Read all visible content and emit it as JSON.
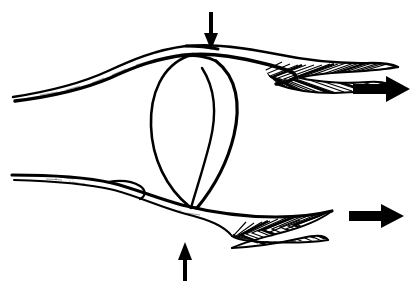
{
  "figure": {
    "title": "Pennate muscle-tendon pair with central bursa loop",
    "domain": "Diagram",
    "background_color": "#ffffff",
    "ink_color": "#000000",
    "canvas": {
      "width": 418,
      "height": 286
    }
  },
  "annotations": {
    "arrow_top_label": "downward compressive force arrow",
    "arrow_bottom_label": "upward compressive force arrow",
    "arrow_right_upper_label": "rightward pull arrow upper",
    "arrow_right_lower_label": "rightward pull arrow lower"
  },
  "structures": {
    "upper_band": {
      "name": "upper muscle tendon band",
      "tendon_region": "left tapering tendon",
      "muscle_region": "right pennate muscle belly"
    },
    "lower_band": {
      "name": "lower muscle tendon band",
      "tendon_region": "left tapering tendon",
      "muscle_region": "right pennate muscle belly"
    },
    "center_loop": {
      "name": "central oval loop",
      "inner_fold": "inner vertical fold line"
    }
  },
  "arrows": {
    "top": {
      "direction": "down",
      "shaft_x": 211,
      "shaft_top_y": 12,
      "shaft_bottom_y": 36,
      "shaft_width": 4,
      "head_half_width": 7,
      "head_tip_y": 50
    },
    "bottom": {
      "direction": "up",
      "shaft_x": 185,
      "shaft_bottom_y": 281,
      "shaft_top_y": 256,
      "shaft_width": 4,
      "head_half_width": 7,
      "head_tip_y": 242
    },
    "right_upper": {
      "direction": "right",
      "tail_x": 353,
      "tip_x": 410,
      "center_y": 89,
      "shaft_half_height": 5,
      "head_half_height": 13,
      "head_back_x": 386
    },
    "right_lower": {
      "direction": "right",
      "tail_x": 349,
      "tip_x": 404,
      "center_y": 216,
      "shaft_half_height": 5,
      "head_half_height": 12,
      "head_back_x": 381
    }
  },
  "paths": {
    "upper_band_outer": "M 13 97 C 45 92 82 83 108 71 C 132 60 155 50 186 46 C 215 43 246 48 276 54 C 305 60 340 64 372 63 C 384 63 392 64 396 66 C 384 69 366 70 348 71 C 330 72 312 73 300 76",
    "upper_band_inner": "M 15 100 C 48 97 84 89 110 78 C 134 67 157 58 186 55 C 214 52 242 58 270 65 C 298 72 330 78 360 81 C 374 82 386 84 392 87 C 378 90 358 91 340 92 C 318 93 304 92 295 88",
    "lower_band_outer": "M 12 175 C 50 175 86 177 112 183 C 136 189 156 198 182 205 C 210 212 244 217 276 217 C 296 217 314 215 328 212 C 318 219 300 226 282 231 C 262 236 244 240 232 246",
    "lower_band_inner": "M 14 179 C 52 180 88 183 114 189 C 140 196 160 206 186 213 C 216 221 248 228 278 232 C 296 234 312 236 322 239 C 306 241 286 241 266 240 C 248 239 238 238 232 236",
    "center_loop_left": "M 186 56 C 160 68 150 96 152 126 C 154 158 168 188 190 206",
    "center_loop_right": "M 216 62 C 236 76 240 104 234 134 C 228 164 212 190 198 207",
    "center_loop_fold": "M 200 68 C 214 86 216 112 210 140 C 204 168 196 192 192 208"
  },
  "hatching": {
    "upper_muscle_chevrons": 16,
    "lower_muscle_chevrons": 15,
    "style": "herringbone pennate fiber hatching"
  }
}
